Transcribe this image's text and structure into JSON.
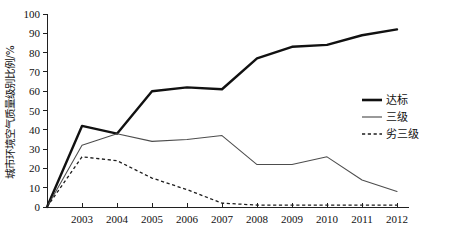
{
  "chart_data": {
    "type": "line",
    "title": "",
    "xlabel": "",
    "ylabel": "城市环境空气质量级别比例/%",
    "xlim": [
      2002,
      2012
    ],
    "ylim": [
      0,
      100
    ],
    "grid": false,
    "legend_position": "right-middle",
    "x": [
      2002,
      2003,
      2004,
      2005,
      2006,
      2007,
      2008,
      2009,
      2010,
      2011,
      2012
    ],
    "x_tick_labels": [
      "",
      "2003",
      "2004",
      "2005",
      "2006",
      "2007",
      "2008",
      "2009",
      "2010",
      "2011",
      "2012"
    ],
    "y_tick_labels": [
      "0",
      "10",
      "20",
      "30",
      "40",
      "50",
      "60",
      "70",
      "80",
      "90",
      "100"
    ],
    "y_ticks": [
      0,
      10,
      20,
      30,
      40,
      50,
      60,
      70,
      80,
      90,
      100
    ],
    "series": [
      {
        "name": "达标",
        "style": "solid-thick",
        "color": "#111111",
        "values": [
          0,
          42,
          38,
          60,
          62,
          61,
          77,
          83,
          84,
          89,
          92
        ]
      },
      {
        "name": "三级",
        "style": "solid-thin",
        "color": "#4d4d4d",
        "values": [
          0,
          32,
          38,
          34,
          35,
          37,
          22,
          22,
          26,
          14,
          8
        ]
      },
      {
        "name": "劣三级",
        "style": "dotted",
        "color": "#1d1d1d",
        "values": [
          0,
          26,
          24,
          15,
          9,
          2,
          1,
          1,
          1,
          1,
          1
        ]
      }
    ]
  },
  "legend": {
    "entries": [
      {
        "label": "达标"
      },
      {
        "label": "三级"
      },
      {
        "label": "劣三级"
      }
    ]
  },
  "axis": {
    "y_title": "城市环境空气质量级别比例/%"
  }
}
